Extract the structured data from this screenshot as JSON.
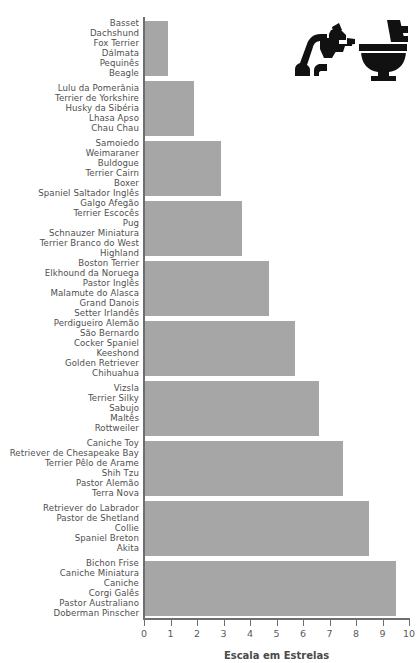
{
  "chart_data": {
    "type": "bar",
    "orientation": "horizontal",
    "title": "",
    "xlabel": "Escala em Estrelas",
    "ylabel": "",
    "xlim": [
      0,
      10
    ],
    "xticks": [
      "0",
      "1",
      "2",
      "3",
      "4",
      "5",
      "6",
      "7",
      "8",
      "9",
      "10"
    ],
    "grid": false,
    "legend": null,
    "bar_color": "#a6a6a6",
    "axis_color": "#6e6e6e",
    "categories": [
      "Basset / Dachshund / Fox Terrier / Dalmata / Pequines / Beagle",
      "Lulu da Pomerania / Terrier de Yorkshire / Husky da Siberia / Lhasa Apso / Chau Chau",
      "Samoiedo / Weimaraner / Buldogue / Terrier Cairn / Boxer / Spaniel Saltador Ingles",
      "Galgo Afegao / Terrier Escoces / Pug / Schnauzer Miniatura / Terrier Branco do West Highland",
      "Boston Terrier / Elkhound da Noruega / Pastor Ingles / Malamute do Alasca / Grand Danois / Setter Irlandes",
      "Perdigueiro Alemao / Sao Bernardo / Cocker Spaniel / Keeshond / Golden Retriever / Chihuahua",
      "Vizsla / Terrier Silky / Sabujo / Maltes / Rottweiler",
      "Caniche Toy / Retriever de Chesapeake Bay / Terrier Pelo de Arame / Shih Tzu / Pastor Alemao / Terra Nova",
      "Retriever do Labrador / Pastor de Shetland / Collie / Spaniel Breton / Akita",
      "Bichon Frise / Caniche Miniatura / Caniche / Corgi Gales / Pastor Australiano / Doberman Pinscher"
    ],
    "values": [
      0.9,
      1.9,
      2.9,
      3.7,
      4.7,
      5.7,
      6.6,
      7.5,
      8.5,
      9.5
    ],
    "groups": [
      {
        "value": 0.9,
        "breeds": [
          "Basset",
          "Dachshund",
          "Fox Terrier",
          "Dálmata",
          "Pequinês",
          "Beagle"
        ]
      },
      {
        "value": 1.9,
        "breeds": [
          "Lulu da Pomerânia",
          "Terrier de Yorkshire",
          "Husky da Sibéria",
          "Lhasa Apso",
          "Chau Chau"
        ]
      },
      {
        "value": 2.9,
        "breeds": [
          "Samoiedo",
          "Weimaraner",
          "Buldogue",
          "Terrier Cairn",
          "Boxer",
          "Spaniel Saltador Inglês"
        ]
      },
      {
        "value": 3.7,
        "breeds": [
          "Galgo Afegão",
          "Terrier Escocês",
          "Pug",
          "Schnauzer Miniatura",
          "Terrier Branco do West",
          "Highland"
        ]
      },
      {
        "value": 4.7,
        "breeds": [
          "Boston Terrier",
          "Elkhound da Noruega",
          "Pastor Inglês",
          "Malamute do Alasca",
          "Grand Danois",
          "Setter Irlandês"
        ]
      },
      {
        "value": 5.7,
        "breeds": [
          "Perdigueiro Alemão",
          "São Bernardo",
          "Cocker Spaniel",
          "Keeshond",
          "Golden Retriever",
          "Chihuahua"
        ]
      },
      {
        "value": 6.6,
        "breeds": [
          "Vizsla",
          "Terrier Silky",
          "Sabujo",
          "Maltês",
          "Rottweiler"
        ]
      },
      {
        "value": 7.5,
        "breeds": [
          "Caniche Toy",
          "Retriever de Chesapeake Bay",
          "Terrier Pêlo de Arame",
          "Shih Tzu",
          "Pastor Alemão",
          "Terra Nova"
        ]
      },
      {
        "value": 8.5,
        "breeds": [
          "Retriever do Labrador",
          "Pastor de Shetland",
          "Collie",
          "Spaniel Breton",
          "Akita"
        ]
      },
      {
        "value": 9.5,
        "breeds": [
          "Bichon Frise",
          "Caniche Miniatura",
          "Caniche",
          "Corgi Galês",
          "Pastor Australiano",
          "Doberman Pinscher"
        ]
      }
    ]
  },
  "decoration": {
    "icon_name": "dog-at-toilet-icon"
  }
}
